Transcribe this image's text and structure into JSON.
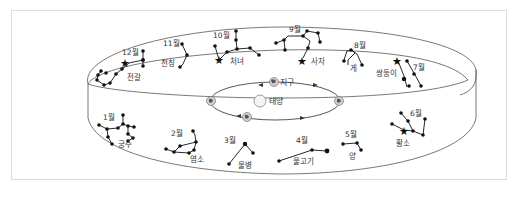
{
  "diagram": {
    "sun_label": "태양",
    "earth_label": "지구",
    "constellations": [
      {
        "month": "1월",
        "name": "궁수"
      },
      {
        "month": "2월",
        "name": "염소"
      },
      {
        "month": "3월",
        "name": "물병"
      },
      {
        "month": "4월",
        "name": "물고기"
      },
      {
        "month": "5월",
        "name": "양"
      },
      {
        "month": "6월",
        "name": "황소"
      },
      {
        "month": "7월",
        "name": "쌍둥이"
      },
      {
        "month": "8월",
        "name": "게"
      },
      {
        "month": "9월",
        "name": "사자"
      },
      {
        "month": "10월",
        "name": "처녀"
      },
      {
        "month": "11월",
        "name": "천칭"
      },
      {
        "month": "12월",
        "name": "전갈"
      }
    ],
    "colors": {
      "line": "#111111",
      "frame": "#dcdcdc",
      "text": "#333333"
    }
  }
}
